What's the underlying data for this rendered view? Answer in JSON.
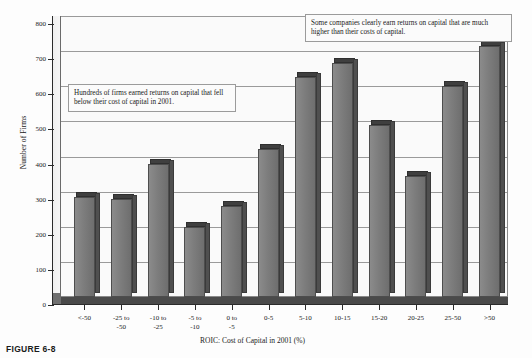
{
  "chart_data": {
    "type": "bar",
    "title": "",
    "xlabel": "ROIC: Cost of Capital in 2001 (%)",
    "ylabel": "Number of Firms",
    "ylim": [
      0,
      800
    ],
    "ytick_step": 100,
    "yticks": [
      "0",
      "100",
      "200",
      "300",
      "400",
      "500",
      "600",
      "700",
      "800"
    ],
    "grid": true,
    "legend": "none",
    "style": "3d-column",
    "categories": [
      "<-50",
      "-25 to -50",
      "-10 to -25",
      "-5 to -10",
      "0 to -5",
      "0-5",
      "5-10",
      "10-15",
      "15-20",
      "20-25",
      "25-50",
      ">50"
    ],
    "category_lines": [
      [
        "<-50",
        ""
      ],
      [
        "-25 to",
        "-50"
      ],
      [
        "-10 to",
        "-25"
      ],
      [
        "-5 to",
        "-10"
      ],
      [
        "0 to",
        "-5"
      ],
      [
        "0-5",
        ""
      ],
      [
        "5-10",
        ""
      ],
      [
        "10-15",
        ""
      ],
      [
        "15-20",
        ""
      ],
      [
        "20-25",
        ""
      ],
      [
        "25-50",
        ""
      ],
      [
        ">50",
        ""
      ]
    ],
    "values": [
      285,
      280,
      380,
      200,
      260,
      420,
      625,
      665,
      490,
      345,
      600,
      715
    ],
    "annotations": [
      {
        "id": "left-note",
        "text": "Hundreds of firms earned returns on capital that fell below their cost of capital in 2001."
      },
      {
        "id": "right-note",
        "text": "Some companies clearly earn returns on capital that are much higher than their costs of capital."
      }
    ]
  },
  "figure": {
    "caption": "FIGURE 6-8"
  },
  "colors": {
    "bar_front": "#7d7d7d",
    "bar_side": "#4f4f4f",
    "bar_top": "#3f3f3f",
    "plot_bg": "#fafafa",
    "grid": "#9a9a9a",
    "axis": "#2b2b2b"
  }
}
